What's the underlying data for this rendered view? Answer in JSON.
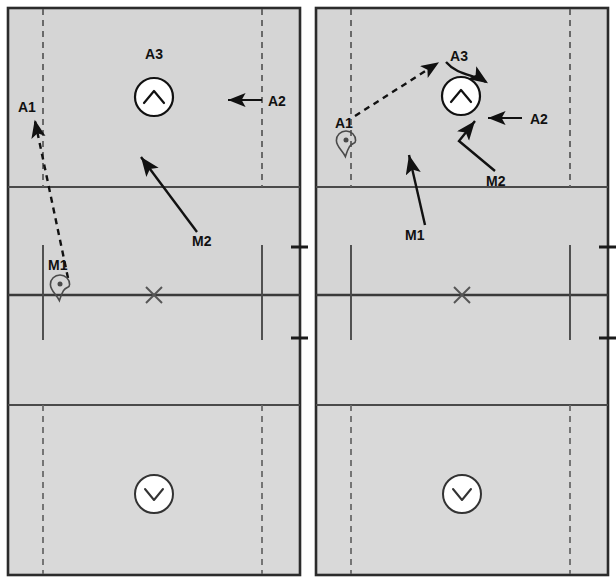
{
  "diagram": {
    "title_visible": false,
    "type": "volleyball-court-tactics-pair",
    "colors": {
      "court_fill": "#d4d4d4",
      "court_fill_light": "#dcdcdc",
      "court_line": "#4a4a4a",
      "court_border": "#2b2b2b",
      "dashed_line": "#5a5a5a",
      "annotation": "#111111",
      "marker_fill": "#ffffff",
      "background": "#ffffff"
    },
    "court_geometry": {
      "left_edge_x": 8,
      "right_edge_x": 300,
      "top_edge_y": 8,
      "bottom_edge_y": 575,
      "attack_line_top_y": 187,
      "net_line_y": 295,
      "attack_line_bottom_y": 405,
      "dashed_left_x": 43,
      "dashed_right_x": 262,
      "short_solid_left_x": 43,
      "short_solid_right_x": 262,
      "short_solid_top_y": 245,
      "short_solid_bottom_y": 340,
      "center_mark_x": 154,
      "center_mark_y": 295
    },
    "panels": [
      {
        "id": "panel-left",
        "name": "left-court-diagram",
        "net_tick_upper": {
          "x1": 290,
          "x2": 308,
          "y": 247
        },
        "net_tick_lower": {
          "x1": 290,
          "x2": 308,
          "y": 338
        },
        "labels": [
          {
            "name": "label-a3",
            "text": "A3",
            "x": 154,
            "y": 54
          },
          {
            "name": "label-a2",
            "text": "A2",
            "x": 275,
            "y": 110
          },
          {
            "name": "label-a1",
            "text": "A1",
            "x": 30,
            "y": 108
          },
          {
            "name": "label-m2",
            "text": "M2",
            "x": 205,
            "y": 242
          },
          {
            "name": "label-m1",
            "text": "M1",
            "x": 63,
            "y": 268
          }
        ],
        "player_circles": [
          {
            "name": "player-circle-a3",
            "glyph": "chevron-up",
            "cx": 154,
            "cy": 97,
            "r": 19
          },
          {
            "name": "player-circle-opponent",
            "glyph": "chevron-down",
            "cx": 154,
            "cy": 494,
            "r": 19
          }
        ],
        "pin_markers": [
          {
            "name": "pin-marker-m1",
            "x": 60,
            "y": 275
          }
        ],
        "arrows": [
          {
            "name": "arrow-a1-dashed",
            "style": "dashed",
            "kind": "line",
            "from": [
              68,
              278
            ],
            "to": [
              34,
              118
            ]
          },
          {
            "name": "arrow-a2-solid",
            "style": "solid",
            "kind": "line",
            "from": [
              262,
              100
            ],
            "to": [
              226,
              100
            ]
          },
          {
            "name": "arrow-m2-solid",
            "style": "solid",
            "kind": "line",
            "from": [
              196,
              231
            ],
            "to": [
              140,
              155
            ]
          }
        ]
      },
      {
        "id": "panel-right",
        "name": "right-court-diagram",
        "net_tick_upper": {
          "x1": 290,
          "x2": 308,
          "y": 247
        },
        "net_tick_lower": {
          "x1": 290,
          "x2": 308,
          "y": 338
        },
        "labels": [
          {
            "name": "label-a3",
            "text": "A3",
            "x": 151,
            "y": 56
          },
          {
            "name": "label-a2",
            "text": "A2",
            "x": 231,
            "y": 124
          },
          {
            "name": "label-a1",
            "text": "A1",
            "x": 41,
            "y": 124
          },
          {
            "name": "label-m2",
            "text": "M2",
            "x": 189,
            "y": 181
          },
          {
            "name": "label-m1",
            "text": "M1",
            "x": 108,
            "y": 235
          }
        ],
        "player_circles": [
          {
            "name": "player-circle-a3",
            "glyph": "chevron-up",
            "cx": 153,
            "cy": 96,
            "r": 19
          },
          {
            "name": "player-circle-opponent",
            "glyph": "chevron-down",
            "cx": 154,
            "cy": 494,
            "r": 19
          }
        ],
        "pin_markers": [
          {
            "name": "pin-marker-a1",
            "x": 38,
            "y": 131
          }
        ],
        "arrows": [
          {
            "name": "arrow-a1-dashed",
            "style": "dashed",
            "kind": "line",
            "from": [
              47,
              116
            ],
            "to": [
              132,
              62
            ]
          },
          {
            "name": "arrow-a3-curved",
            "style": "solid",
            "kind": "curve",
            "from": [
              136,
              64
            ],
            "to": [
              180,
              80
            ]
          },
          {
            "name": "arrow-a2-solid",
            "style": "solid",
            "kind": "line",
            "from": [
              214,
              118
            ],
            "to": [
              178,
              118
            ]
          },
          {
            "name": "arrow-m2-bent",
            "style": "solid",
            "kind": "polyline",
            "points": [
              [
                186,
                170
              ],
              [
                152,
                140
              ],
              [
                166,
                118
              ]
            ]
          },
          {
            "name": "arrow-m1-solid",
            "style": "solid",
            "kind": "line",
            "from": [
              116,
              224
            ],
            "to": [
              100,
              152
            ]
          }
        ]
      }
    ]
  }
}
